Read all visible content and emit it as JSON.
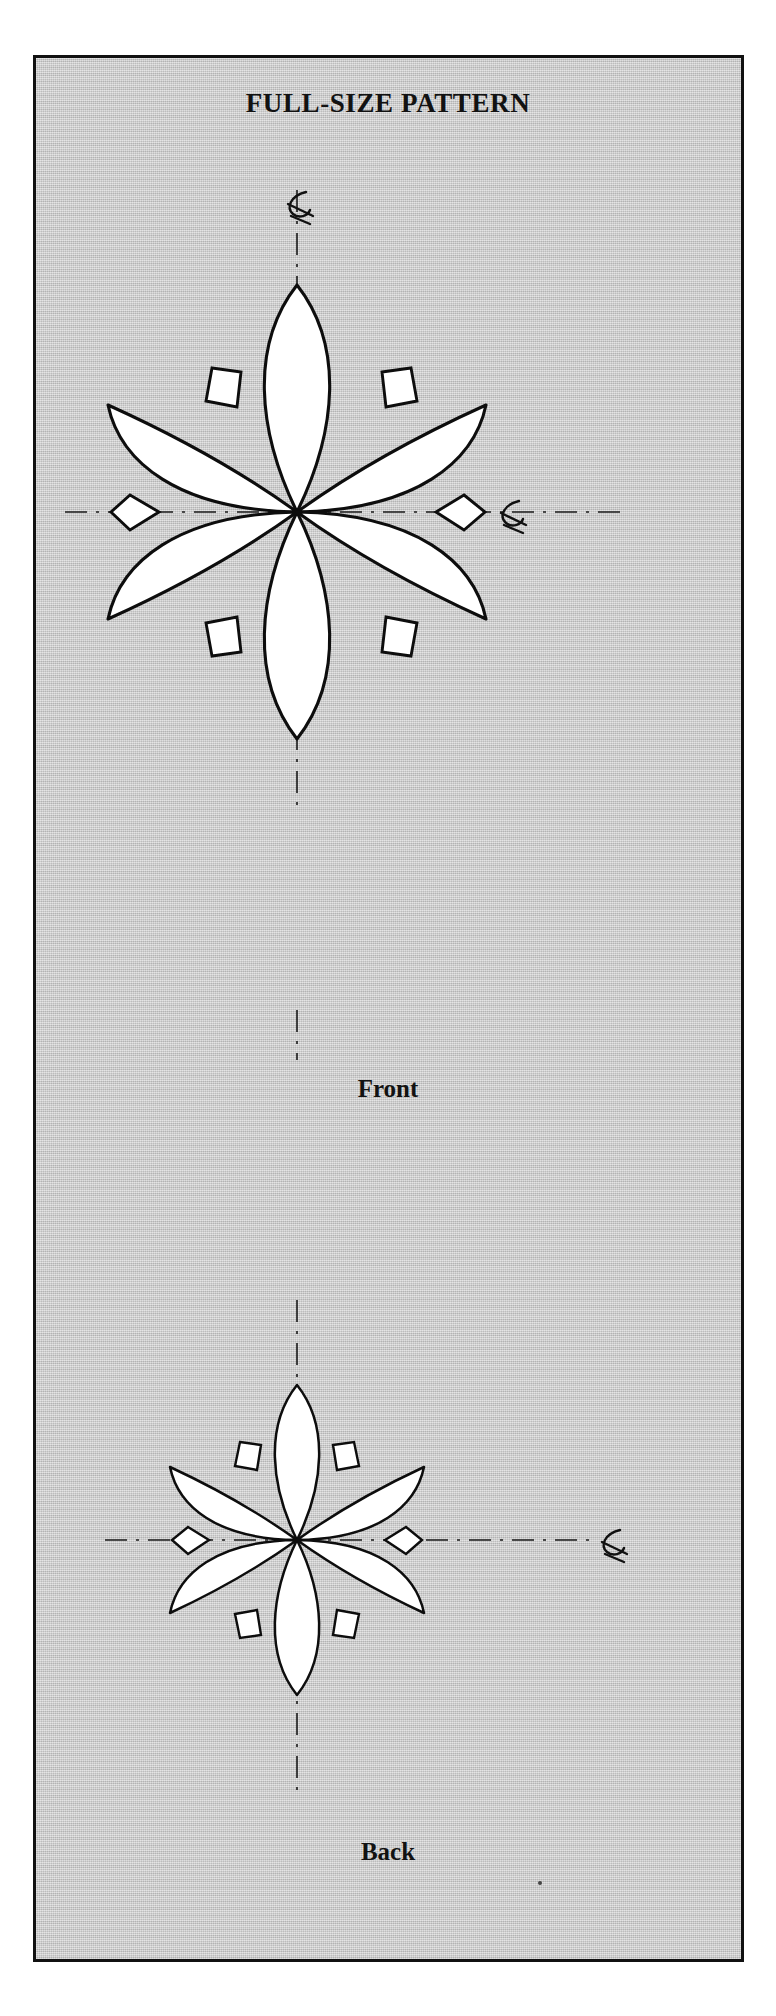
{
  "document": {
    "title": "FULL-SIZE PATTERN",
    "background_color": "#ffffff",
    "panel_color": "#c9c9c9",
    "ink_color": "#0d0d0d",
    "shape_fill": "#ffffff"
  },
  "figures": [
    {
      "id": "front",
      "label": "Front",
      "center": [
        297,
        512
      ],
      "petal_count": 6,
      "diamond_count": 6,
      "petal_length": 215,
      "centerline_marks": [
        "top",
        "right"
      ],
      "centerline_symbol": "CL"
    },
    {
      "id": "back",
      "label": "Back",
      "center": [
        297,
        1540
      ],
      "petal_count": 6,
      "diamond_count": 6,
      "petal_length": 145,
      "centerline_marks": [
        "top",
        "right"
      ],
      "centerline_symbol": "CL"
    }
  ],
  "annotations": {
    "centerline_label": "centerline-mark",
    "vertical_centerline": "vertical-centerline",
    "horizontal_centerline": "horizontal-centerline"
  },
  "icons": {
    "centerline": "centerline-icon"
  }
}
